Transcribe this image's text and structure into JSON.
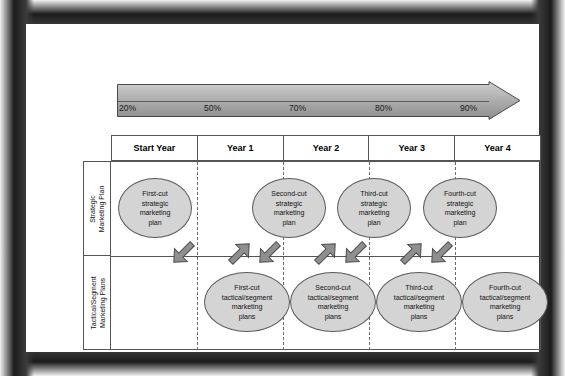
{
  "diagram": {
    "clarity_banner": {
      "label": "INCREASING CLARITY",
      "percentages": [
        "20%",
        "50%",
        "70%",
        "80%",
        "90%"
      ],
      "arrow_icon": "right-arrow-icon"
    },
    "columns": [
      {
        "label": "Start Year"
      },
      {
        "label": "Year 1"
      },
      {
        "label": "Year 2"
      },
      {
        "label": "Year 3"
      },
      {
        "label": "Year 4"
      }
    ],
    "rows": [
      {
        "label": "Strategic\nMarketing Plan",
        "label_line1": "Strategic",
        "label_line2": "Marketing Plan"
      },
      {
        "label": "Tactical/Segment\nMarketing Plans",
        "label_line1": "Tactical/Segment",
        "label_line2": "Marketing Plans"
      }
    ],
    "strategic_nodes": [
      {
        "line1": "First-cut",
        "line2": "strategic",
        "line3": "marketing",
        "line4": "plan"
      },
      {
        "line1": "Second-cut",
        "line2": "strategic",
        "line3": "marketing",
        "line4": "plan"
      },
      {
        "line1": "Third-cut",
        "line2": "strategic",
        "line3": "marketing",
        "line4": "plan"
      },
      {
        "line1": "Fourth-cut",
        "line2": "strategic",
        "line3": "marketing",
        "line4": "plan"
      }
    ],
    "tactical_nodes": [
      {
        "line1": "First-cut",
        "line2": "tactical/segment",
        "line3": "marketing",
        "line4": "plans"
      },
      {
        "line1": "Second-cut",
        "line2": "tactical/segment",
        "line3": "marketing",
        "line4": "plans"
      },
      {
        "line1": "Third-cut",
        "line2": "tactical/segment",
        "line3": "marketing",
        "line4": "plans"
      },
      {
        "line1": "Fourth-cut",
        "line2": "tactical/segment",
        "line3": "marketing",
        "line4": "plans"
      }
    ],
    "colors": {
      "ellipse_fill": "#d4d4d4",
      "ellipse_border": "#5b5b5b",
      "banner_fill": "#b3b3b3",
      "arrow_fill": "#8a8a8a",
      "grid_line": "#555555",
      "dashed_line": "#6a6a6a",
      "frame": "#1c1c1c"
    }
  }
}
